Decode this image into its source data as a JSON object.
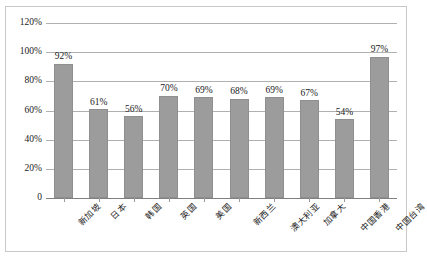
{
  "chart_data": {
    "type": "bar",
    "title": "",
    "subtitle": "",
    "xlabel": "",
    "ylabel": "",
    "categories": [
      "新加坡",
      "日本",
      "韩国",
      "英国",
      "美国",
      "新西兰",
      "澳大利亚",
      "加拿大",
      "中国香港",
      "中国台湾"
    ],
    "values": [
      92,
      61,
      56,
      70,
      69,
      68,
      69,
      67,
      54,
      97
    ],
    "value_labels": [
      "92%",
      "61%",
      "56%",
      "70%",
      "69%",
      "68%",
      "69%",
      "67%",
      "54%",
      "97%"
    ],
    "ylim": [
      0,
      120
    ],
    "ytick_values": [
      0,
      20,
      40,
      60,
      80,
      100,
      120
    ],
    "ytick_labels": [
      "0",
      "20%",
      "40%",
      "60%",
      "80%",
      "100%",
      "120%"
    ],
    "grid": true,
    "legend": "none",
    "series_color": "#9c9c9c",
    "gridline_color": "#b0b0b0",
    "axis_color": "#808080",
    "frame_color": "#c8c8c8",
    "text_color": "#1a1a1a",
    "background": "#ffffff"
  }
}
